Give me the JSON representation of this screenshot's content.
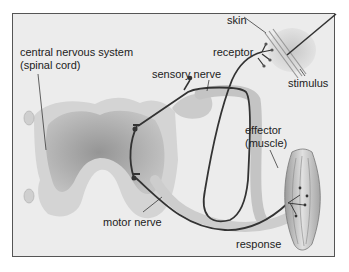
{
  "diagram": {
    "type": "reflex arc",
    "labels": {
      "cns_line1": "central nervous system",
      "cns_line2": "(spinal cord)",
      "sensory_nerve": "sensory nerve",
      "skin": "skin",
      "receptor": "receptor",
      "stimulus": "stimulus",
      "effector_line1": "effector",
      "effector_line2": "(muscle)",
      "motor_nerve": "motor nerve",
      "response": "response"
    },
    "colors": {
      "background": "#ececec",
      "spinal_cord_outer": "#d4d4d4",
      "spinal_cord_inner": "#a8a8a8",
      "nerve": "#333333",
      "nerve_sheath": "#c4c4c4",
      "border": "#555555"
    }
  }
}
